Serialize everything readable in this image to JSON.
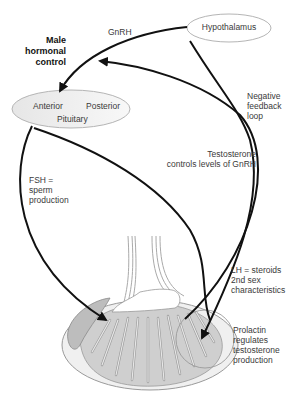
{
  "diagram": {
    "title": [
      "Male",
      "hormonal",
      "control"
    ],
    "nodes": {
      "hypothalamus": "Hypothalamus",
      "pituitary_anterior": "Anterior",
      "pituitary_posterior": "Posterior",
      "pituitary": "Pituitary"
    },
    "labels": {
      "gnrh": "GnRH",
      "negative_feedback": [
        "Negative",
        "feedback",
        "loop"
      ],
      "testosterone": [
        "Testosterone",
        "controls levels of GnRH"
      ],
      "fsh": [
        "FSH =",
        "sperm",
        "production"
      ],
      "lh": [
        "LH = steroids",
        "2nd sex",
        "characteristics"
      ],
      "prolactin": [
        "Prolactin",
        "regulates",
        "testosterone",
        "production"
      ]
    },
    "edges": [
      {
        "from": "Hypothalamus",
        "to": "Pituitary",
        "label": "GnRH"
      },
      {
        "from": "Pituitary",
        "to": "Testis",
        "label": "FSH = sperm production"
      },
      {
        "from": "Pituitary",
        "to": "Testis",
        "label": "LH = steroids 2nd sex characteristics"
      },
      {
        "from": "Testis",
        "to": "Hypothalamus/Pituitary",
        "label": "Negative feedback loop"
      },
      {
        "from": "Hypothalamus",
        "to": "Testis",
        "label": "Prolactin regulates testosterone production"
      }
    ],
    "colors": {
      "arrow": "#111111",
      "node_fill": "#eeeeee",
      "node_stroke": "#b5b5b5",
      "tissue": "#bdbdbd"
    }
  }
}
